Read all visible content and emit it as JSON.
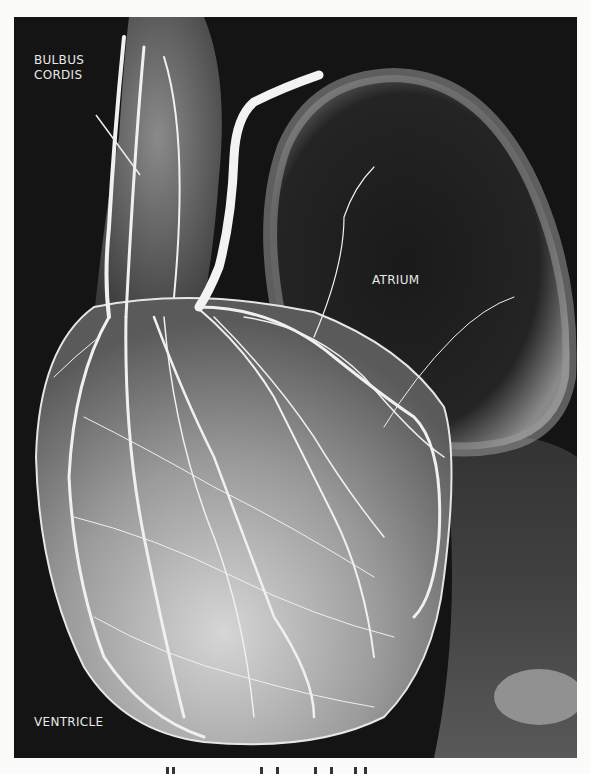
{
  "figure": {
    "labels": {
      "bulbus_cordis_line1": "BULBUS",
      "bulbus_cordis_line2": "CORDIS",
      "atrium": "ATRIUM",
      "ventricle": "VENTRICLE"
    },
    "colors": {
      "background": "#141414",
      "page": "#fbfbfa",
      "vessel": "#f2f2f2",
      "label_text": "#e8e8e8"
    }
  }
}
